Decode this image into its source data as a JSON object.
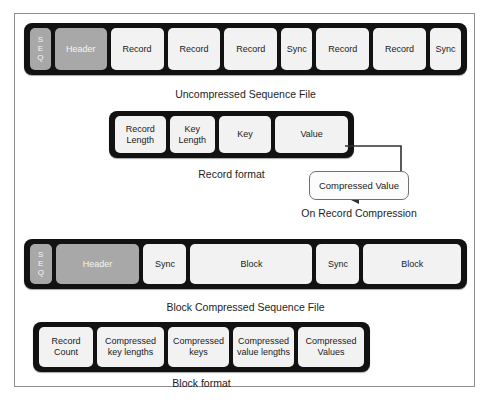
{
  "page": {
    "top_cut_text": "",
    "watermark_text": ""
  },
  "diagram": {
    "sections": [
      {
        "id": "uncompressed-sequence-file",
        "caption": "Uncompressed Sequence File",
        "cells": [
          {
            "label": "S E Q",
            "letters": [
              "S",
              "E",
              "Q"
            ],
            "style": "seq"
          },
          {
            "label": "Header",
            "style": "gray"
          },
          {
            "label": "Record",
            "style": "light"
          },
          {
            "label": "Record",
            "style": "light"
          },
          {
            "label": "Record",
            "style": "light"
          },
          {
            "label": "Sync",
            "style": "light"
          },
          {
            "label": "Record",
            "style": "light"
          },
          {
            "label": "Record",
            "style": "light"
          },
          {
            "label": "Sync",
            "style": "light"
          }
        ]
      },
      {
        "id": "record-format",
        "caption": "Record format",
        "cells": [
          {
            "label": "Record Length",
            "style": "light"
          },
          {
            "label": "Key Length",
            "style": "light"
          },
          {
            "label": "Key",
            "style": "light"
          },
          {
            "label": "Value",
            "style": "light"
          }
        ]
      },
      {
        "id": "on-record-compression",
        "caption": "On Record Compression",
        "box_label": "Compressed Value"
      },
      {
        "id": "block-compressed-sequence-file",
        "caption": "Block Compressed Sequence File",
        "cells": [
          {
            "label": "S E Q",
            "letters": [
              "S",
              "E",
              "Q"
            ],
            "style": "seq"
          },
          {
            "label": "Header",
            "style": "gray"
          },
          {
            "label": "Sync",
            "style": "light"
          },
          {
            "label": "Block",
            "style": "light"
          },
          {
            "label": "Sync",
            "style": "light"
          },
          {
            "label": "Block",
            "style": "light"
          }
        ]
      },
      {
        "id": "block-format",
        "caption": "Block format",
        "cells": [
          {
            "label": "Record Count",
            "style": "light"
          },
          {
            "label": "Compressed key lengths",
            "style": "light"
          },
          {
            "label": "Compressed keys",
            "style": "light"
          },
          {
            "label": "Compressed value lengths",
            "style": "light"
          },
          {
            "label": "Compressed Values",
            "style": "light"
          }
        ]
      }
    ]
  },
  "colors": {
    "bar_black": "#121212",
    "cell_light": "#f2f2f2",
    "cell_gray": "#a8a8a8",
    "frame_border": "#8e8e8e",
    "text": "#1a1a1a"
  }
}
